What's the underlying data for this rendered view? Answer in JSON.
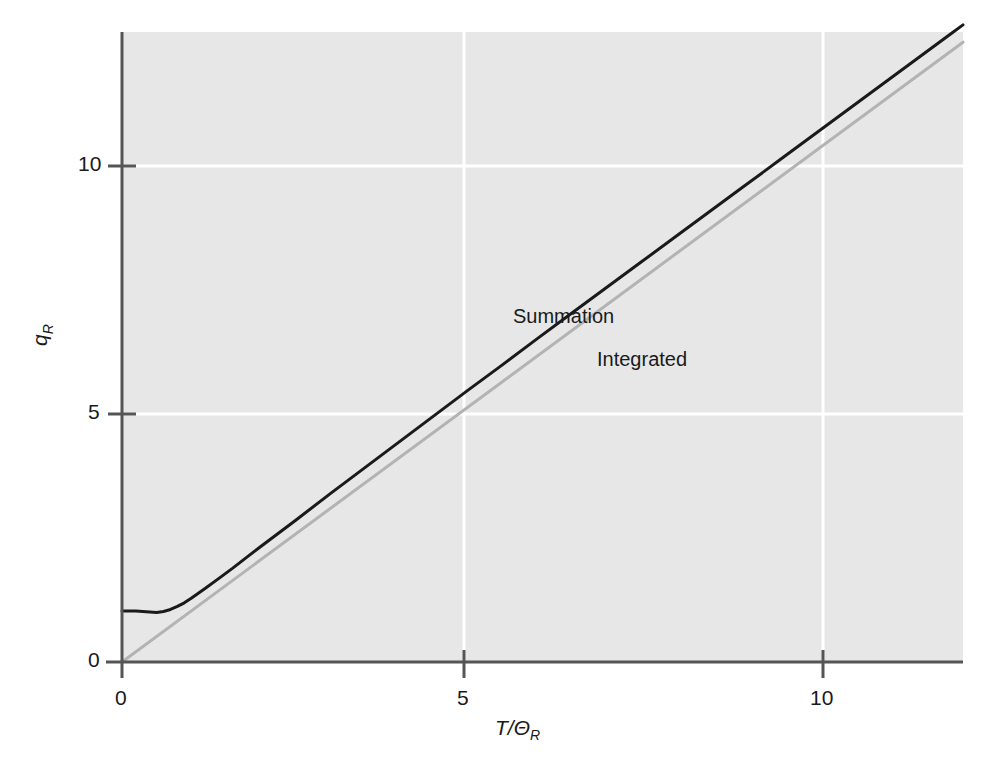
{
  "chart_data": {
    "type": "line",
    "title": "",
    "subtitle": "",
    "xlabel": "T/ΘR",
    "xlabel_base": "T/Θ",
    "xlabel_sub": "R",
    "ylabel": "qR",
    "ylabel_base": "q",
    "ylabel_sub": "R",
    "xlim": [
      0,
      12.15
    ],
    "ylim": [
      0,
      12.35
    ],
    "xticks": [
      0,
      5,
      10
    ],
    "xtick_labels": [
      "0",
      "5",
      "10"
    ],
    "yticks": [
      0,
      5,
      10
    ],
    "ytick_labels": [
      "0",
      "5",
      "10"
    ],
    "grid": true,
    "grid_color": "#ffffff",
    "plot_background": "#e7e7e7",
    "page_background": "#ffffff",
    "axis_color": "#555555",
    "legend_position": "inline-annotations",
    "annotations": [
      {
        "text": "Summation",
        "x": 6.0,
        "y": 6.95,
        "color": "#1a1a1a"
      },
      {
        "text": "Integrated",
        "x": 7.3,
        "y": 5.7,
        "color": "#1a1a1a"
      }
    ],
    "series": [
      {
        "name": "Summation",
        "color": "#1a1a1a",
        "line_width": 3.0,
        "x": [
          0.0,
          0.1,
          0.2,
          0.3,
          0.4,
          0.5,
          0.6,
          0.7,
          0.8,
          0.9,
          1.0,
          1.2,
          1.4,
          1.6,
          1.8,
          2.0,
          2.5,
          3.0,
          3.5,
          4.0,
          4.5,
          5.0,
          5.5,
          6.0,
          6.5,
          7.0,
          7.5,
          8.0,
          8.5,
          9.0,
          9.5,
          10.0,
          10.5,
          11.0,
          11.5,
          12.0,
          12.15
        ],
        "y": [
          1.0,
          1.0,
          1.0,
          0.99,
          0.98,
          0.97,
          0.99,
          1.03,
          1.09,
          1.16,
          1.25,
          1.44,
          1.64,
          1.84,
          2.05,
          2.26,
          2.77,
          3.29,
          3.8,
          4.31,
          4.82,
          5.33,
          5.83,
          6.34,
          6.84,
          7.34,
          7.84,
          8.34,
          8.84,
          9.34,
          9.84,
          10.34,
          10.84,
          11.34,
          11.84,
          12.34,
          12.49
        ]
      },
      {
        "name": "Integrated",
        "color": "#b3b3b3",
        "line_width": 3.0,
        "x": [
          0.0,
          12.15
        ],
        "y": [
          0.0,
          12.15
        ]
      }
    ]
  },
  "axes": {
    "x_tick_0": "0",
    "x_tick_5": "5",
    "x_tick_10": "10",
    "y_tick_0": "0",
    "y_tick_5": "5",
    "y_tick_10": "10",
    "x_title_base": "T/Θ",
    "x_title_sub": "R",
    "y_title_base": "q",
    "y_title_sub": "R"
  },
  "labels": {
    "summation": "Summation",
    "integrated": "Integrated"
  }
}
